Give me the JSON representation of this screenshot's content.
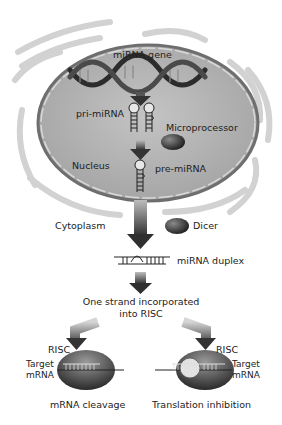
{
  "diagram": {
    "labels": {
      "mirna_gene": "miRNA gene",
      "pri_mirna": "pri-miRNA",
      "microprocessor": "Microprocessor",
      "nucleus": "Nucleus",
      "pre_mirna": "pre-miRNA",
      "cytoplasm": "Cytoplasm",
      "dicer": "Dicer",
      "mirna_duplex": "miRNA duplex",
      "one_strand_line1": "One strand incorporated",
      "one_strand_line2": "into RISC",
      "risc_left": "RISC",
      "risc_right": "RISC",
      "target_left_1": "Target",
      "target_left_2": "mRNA",
      "target_right_1": "Target",
      "target_right_2": "mRNA",
      "outcome_left": "mRNA cleavage",
      "outcome_right": "Translation inhibition"
    },
    "colors": {
      "nucleus_fill": "#b5b5b5",
      "nucleus_border": "#7a7a7a",
      "arrow": "#3a3a3a",
      "blob": "#2e2e2e",
      "er": "#cfcfcf",
      "text": "#222222"
    }
  }
}
